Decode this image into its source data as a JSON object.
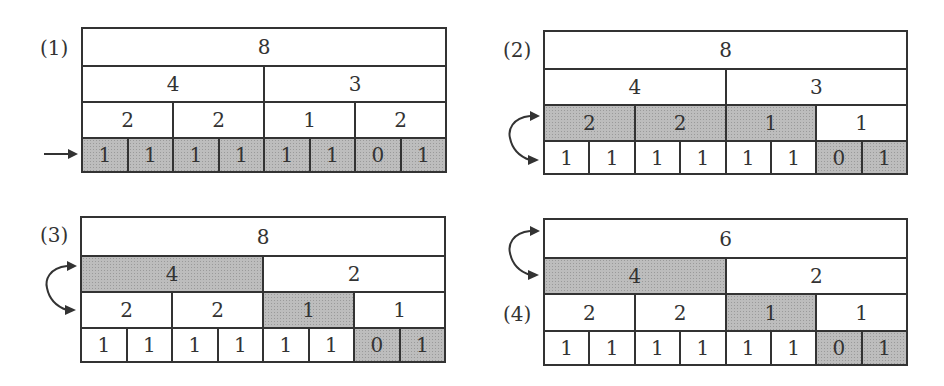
{
  "figure": {
    "panels": [
      {
        "label": "(1)",
        "rows": [
          {
            "cells": [
              {
                "value": "8",
                "shaded": false
              }
            ]
          },
          {
            "cells": [
              {
                "value": "4",
                "shaded": false
              },
              {
                "value": "3",
                "shaded": false
              }
            ]
          },
          {
            "cells": [
              {
                "value": "2",
                "shaded": false
              },
              {
                "value": "2",
                "shaded": false
              },
              {
                "value": "1",
                "shaded": false
              },
              {
                "value": "2",
                "shaded": false
              }
            ]
          },
          {
            "cells": [
              {
                "value": "1",
                "shaded": true
              },
              {
                "value": "1",
                "shaded": true
              },
              {
                "value": "1",
                "shaded": true
              },
              {
                "value": "1",
                "shaded": true
              },
              {
                "value": "1",
                "shaded": true
              },
              {
                "value": "1",
                "shaded": true
              },
              {
                "value": "0",
                "shaded": true
              },
              {
                "value": "1",
                "shaded": true
              }
            ]
          }
        ],
        "indicator": {
          "type": "right-arrow",
          "row": 3
        }
      },
      {
        "label": "(2)",
        "rows": [
          {
            "cells": [
              {
                "value": "8",
                "shaded": false
              }
            ]
          },
          {
            "cells": [
              {
                "value": "4",
                "shaded": false
              },
              {
                "value": "3",
                "shaded": false
              }
            ]
          },
          {
            "cells": [
              {
                "value": "2",
                "shaded": true
              },
              {
                "value": "2",
                "shaded": true
              },
              {
                "value": "1",
                "shaded": true
              },
              {
                "value": "1",
                "shaded": false
              }
            ]
          },
          {
            "cells": [
              {
                "value": "1",
                "shaded": false
              },
              {
                "value": "1",
                "shaded": false
              },
              {
                "value": "1",
                "shaded": false
              },
              {
                "value": "1",
                "shaded": false
              },
              {
                "value": "1",
                "shaded": false
              },
              {
                "value": "1",
                "shaded": false
              },
              {
                "value": "0",
                "shaded": true
              },
              {
                "value": "1",
                "shaded": true
              }
            ]
          }
        ],
        "indicator": {
          "type": "curved-double-arrow",
          "rows": [
            2,
            3
          ]
        }
      },
      {
        "label": "(3)",
        "rows": [
          {
            "cells": [
              {
                "value": "8",
                "shaded": false
              }
            ]
          },
          {
            "cells": [
              {
                "value": "4",
                "shaded": true
              },
              {
                "value": "2",
                "shaded": false
              }
            ]
          },
          {
            "cells": [
              {
                "value": "2",
                "shaded": false
              },
              {
                "value": "2",
                "shaded": false
              },
              {
                "value": "1",
                "shaded": true
              },
              {
                "value": "1",
                "shaded": false
              }
            ]
          },
          {
            "cells": [
              {
                "value": "1",
                "shaded": false
              },
              {
                "value": "1",
                "shaded": false
              },
              {
                "value": "1",
                "shaded": false
              },
              {
                "value": "1",
                "shaded": false
              },
              {
                "value": "1",
                "shaded": false
              },
              {
                "value": "1",
                "shaded": false
              },
              {
                "value": "0",
                "shaded": true
              },
              {
                "value": "1",
                "shaded": true
              }
            ]
          }
        ],
        "indicator": {
          "type": "curved-double-arrow",
          "rows": [
            1,
            2
          ]
        }
      },
      {
        "label": "(4)",
        "rows": [
          {
            "cells": [
              {
                "value": "6",
                "shaded": false
              }
            ]
          },
          {
            "cells": [
              {
                "value": "4",
                "shaded": true
              },
              {
                "value": "2",
                "shaded": false
              }
            ]
          },
          {
            "cells": [
              {
                "value": "2",
                "shaded": false
              },
              {
                "value": "2",
                "shaded": false
              },
              {
                "value": "1",
                "shaded": true
              },
              {
                "value": "1",
                "shaded": false
              }
            ]
          },
          {
            "cells": [
              {
                "value": "1",
                "shaded": false
              },
              {
                "value": "1",
                "shaded": false
              },
              {
                "value": "1",
                "shaded": false
              },
              {
                "value": "1",
                "shaded": false
              },
              {
                "value": "1",
                "shaded": false
              },
              {
                "value": "1",
                "shaded": false
              },
              {
                "value": "0",
                "shaded": true
              },
              {
                "value": "1",
                "shaded": true
              }
            ]
          }
        ],
        "indicator": {
          "type": "curved-double-arrow",
          "rows": [
            0,
            1
          ]
        }
      }
    ],
    "colors": {
      "line": "#333333",
      "shade": "#bdbdbd",
      "background": "#ffffff"
    }
  }
}
